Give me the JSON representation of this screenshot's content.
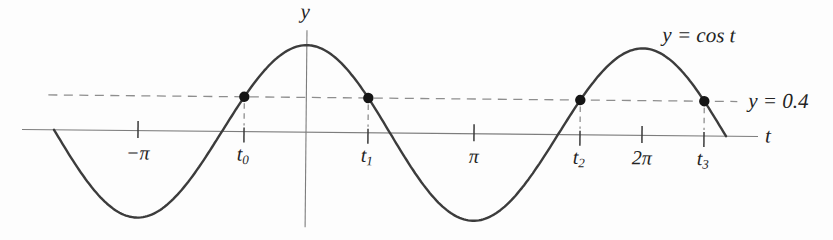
{
  "figure": {
    "axis_labels": {
      "x": "t",
      "y": "y"
    },
    "curve_label": "y = cos t",
    "threshold_label": "y = 0.4",
    "colors": {
      "curve": "#3c3c3c",
      "axis": "#7d7d7d",
      "dashed": "#8e8e8e",
      "tick": "#3a3a3a",
      "dot": "#151515",
      "text": "#242424"
    }
  },
  "chart_data": {
    "type": "line",
    "title": "",
    "expression": "y = cos t",
    "xlabel": "t",
    "ylabel": "y",
    "t_domain": [
      -4.712,
      7.854
    ],
    "y_range": [
      -1,
      1
    ],
    "amplitude": 1,
    "threshold": 0.4,
    "threshold_label": "y = 0.4",
    "curve_label": "y = cos t",
    "pi_ticks": [
      {
        "label": "−π",
        "t": -3.1416
      },
      {
        "label": "π",
        "t": 3.1416
      },
      {
        "label": "2π",
        "t": 6.2832
      }
    ],
    "solution_points": [
      {
        "base": "t",
        "sub": "0",
        "t": -1.1593,
        "y": 0.4
      },
      {
        "base": "t",
        "sub": "1",
        "t": 1.1593,
        "y": 0.4
      },
      {
        "base": "t",
        "sub": "2",
        "t": 5.1239,
        "y": 0.4
      },
      {
        "base": "t",
        "sub": "3",
        "t": 7.4425,
        "y": 0.4
      }
    ],
    "legend": [],
    "grid": false
  }
}
